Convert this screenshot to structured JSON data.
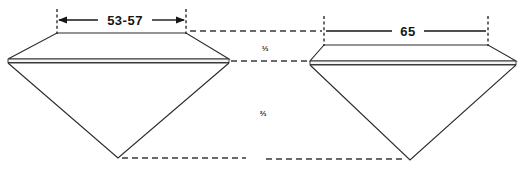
{
  "figure": {
    "background_color": "#ffffff",
    "line_color": "#2b2b2b",
    "text_color": "#161616",
    "width": 524,
    "height": 174
  },
  "dimensions": {
    "left_table_label": "53-57",
    "right_table_label": "65"
  },
  "fractions": {
    "crown_label": "⅓",
    "pavilion_label": "⅔"
  },
  "stones": [
    {
      "name": "left-stone",
      "table_width_label": "53-57",
      "girdle_tip_left_x": 8,
      "girdle_tip_right_x": 229,
      "table_left_x": 57,
      "table_right_x": 186,
      "table_y": 33,
      "girdle_y": 60,
      "culet_x": 118,
      "culet_y": 158
    },
    {
      "name": "right-stone",
      "table_width_label": "65",
      "girdle_tip_left_x": 310,
      "girdle_tip_right_x": 516,
      "table_left_x": 324,
      "table_right_x": 488,
      "table_y": 45,
      "girdle_y": 62,
      "culet_x": 410,
      "culet_y": 160
    }
  ],
  "reference_lines": {
    "girdle_plane_label": "girdle reference plane",
    "culet_plane_label": "culet depth reference plane"
  }
}
